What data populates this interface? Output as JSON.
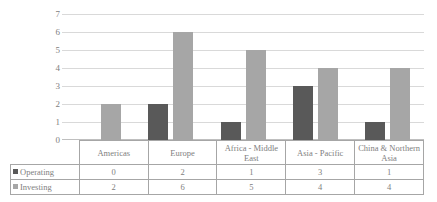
{
  "chart_data": {
    "type": "bar",
    "title": "",
    "xlabel": "",
    "ylabel": "",
    "ylim": [
      0,
      7
    ],
    "yticks": [
      0,
      1,
      2,
      3,
      4,
      5,
      6,
      7
    ],
    "grid": true,
    "legend_position": "table-left",
    "categories": [
      "Americas",
      "Europe",
      "Africa - Middle East",
      "Asia - Pacific",
      "China & Northern Asia"
    ],
    "series": [
      {
        "name": "Operating",
        "color": "#595959",
        "values": [
          0,
          2,
          1,
          3,
          1
        ]
      },
      {
        "name": "Investing",
        "color": "#a6a6a6",
        "values": [
          2,
          6,
          5,
          4,
          4
        ]
      }
    ]
  },
  "table": {
    "header": [
      "Americas",
      "Europe",
      "Africa - Middle East",
      "Asia - Pacific",
      "China & Northern Asia"
    ],
    "rows": [
      {
        "label": "Operating",
        "swatch": "operating-swatch",
        "values": [
          "0",
          "2",
          "1",
          "3",
          "1"
        ]
      },
      {
        "label": "Investing",
        "swatch": "investing-swatch",
        "values": [
          "2",
          "6",
          "5",
          "4",
          "4"
        ]
      }
    ]
  },
  "axis": {
    "y_labels": [
      "7",
      "6",
      "5",
      "4",
      "3",
      "2",
      "1",
      "0"
    ]
  },
  "colors": {
    "operating": "#595959",
    "investing": "#a6a6a6",
    "gridline": "#d9d9d9",
    "border": "#a6a6a6",
    "text": "#808080"
  }
}
